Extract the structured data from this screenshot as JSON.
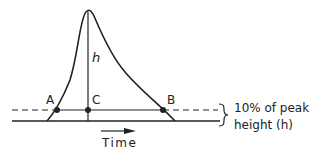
{
  "diagram": {
    "type": "peak-width-diagram",
    "labels": {
      "h": "h",
      "A": "A",
      "B": "B",
      "C": "C",
      "time": "Time",
      "annotation_line1": "10% of peak",
      "annotation_line2": "height (h)"
    },
    "colors": {
      "stroke": "#222222",
      "background": "#ffffff"
    }
  }
}
